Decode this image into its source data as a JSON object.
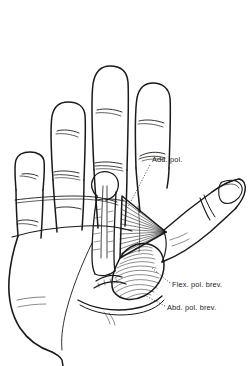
{
  "figure": {
    "background_color": "#ffffff",
    "ink_color": "#1a1a1a",
    "width": 249,
    "height": 366
  },
  "labels": [
    {
      "id": "add-pol",
      "text": "Add. pol.",
      "full_name": "Adductor pollicis",
      "x": 152,
      "y": 162,
      "leader": "dotted",
      "leader_from_x": 150,
      "leader_from_y": 165,
      "leader_to_x": 128,
      "leader_to_y": 207
    },
    {
      "id": "flex-pol-brev",
      "text": "Flex. pol. brev.",
      "full_name": "Flexor pollicis brevis",
      "x": 172,
      "y": 287,
      "leader": "dotted",
      "leader_from_x": 170,
      "leader_from_y": 283,
      "leader_to_x": 152,
      "leader_to_y": 268
    },
    {
      "id": "abd-pol-brev",
      "text": "Abd. pol. brev.",
      "full_name": "Abductor pollicis brevis",
      "x": 167,
      "y": 310,
      "leader": "dotted",
      "leader_from_x": 165,
      "leader_from_y": 306,
      "leader_to_x": 146,
      "leader_to_y": 296
    }
  ],
  "anatomy": {
    "fingers": [
      {
        "name": "index-finger"
      },
      {
        "name": "middle-finger"
      },
      {
        "name": "ring-finger"
      },
      {
        "name": "little-finger"
      }
    ],
    "parts": [
      {
        "name": "palm"
      },
      {
        "name": "thumb"
      },
      {
        "name": "thumbnail"
      },
      {
        "name": "metacarpal-bone"
      },
      {
        "name": "adductor-pollicis-muscle"
      },
      {
        "name": "flexor-pollicis-brevis-muscle"
      },
      {
        "name": "abductor-pollicis-brevis-muscle"
      },
      {
        "name": "wrist"
      }
    ]
  }
}
